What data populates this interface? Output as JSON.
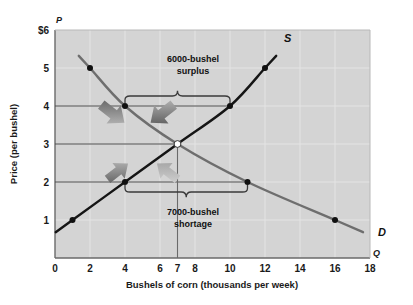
{
  "chart_data": {
    "type": "line",
    "title": "",
    "xlabel": "Bushels of corn (thousands per week)",
    "ylabel": "Price (per bushel)",
    "x_axis_letter": "Q",
    "y_axis_letter": "P",
    "xlim": [
      0,
      18
    ],
    "ylim": [
      0,
      6
    ],
    "grid": true,
    "xticks": [
      "0",
      "2",
      "4",
      "6",
      "7",
      "8",
      "10",
      "12",
      "14",
      "16",
      "18"
    ],
    "xtick_values": [
      0,
      2,
      4,
      6,
      7,
      8,
      10,
      12,
      14,
      16,
      18
    ],
    "yticks": [
      "$6",
      "5",
      "4",
      "3",
      "2",
      "1"
    ],
    "ytick_values": [
      6,
      5,
      4,
      3,
      2,
      1
    ],
    "series": [
      {
        "name": "S",
        "label": "S",
        "description": "Supply curve, upward sloping",
        "color": "#1a1a1a",
        "points": [
          {
            "x": 1,
            "y": 1
          },
          {
            "x": 4,
            "y": 2
          },
          {
            "x": 7,
            "y": 3
          },
          {
            "x": 10,
            "y": 4
          },
          {
            "x": 12,
            "y": 5
          }
        ]
      },
      {
        "name": "D",
        "label": "D",
        "description": "Demand curve, downward sloping",
        "color": "#6e6e6e",
        "points": [
          {
            "x": 2,
            "y": 5
          },
          {
            "x": 4,
            "y": 4
          },
          {
            "x": 7,
            "y": 3
          },
          {
            "x": 11,
            "y": 2
          },
          {
            "x": 16,
            "y": 1
          }
        ]
      }
    ],
    "equilibrium": {
      "x": 7,
      "y": 3,
      "marker": "hollow-circle"
    },
    "reference_lines": [
      {
        "type": "horizontal",
        "value": 4,
        "from_x": 0,
        "to_x": 10
      },
      {
        "type": "horizontal",
        "value": 3,
        "from_x": 0,
        "to_x": 7
      },
      {
        "type": "horizontal",
        "value": 2,
        "from_x": 0,
        "to_x": 11
      },
      {
        "type": "vertical",
        "value": 7,
        "from_y": 0,
        "to_y": 3
      }
    ],
    "annotations": [
      {
        "id": "surplus",
        "line1": "6000-bushel",
        "line2": "surplus",
        "price": 4,
        "from_x": 4,
        "to_x": 10,
        "quantity": 6000,
        "brace": "below-text"
      },
      {
        "id": "shortage",
        "line1": "7000-bushel",
        "line2": "shortage",
        "price": 2,
        "from_x": 4,
        "to_x": 11,
        "quantity": 7000,
        "brace": "above-text"
      }
    ],
    "arrows": [
      {
        "id": "surplus-left-arrow",
        "direction": "down-right",
        "region": "surplus"
      },
      {
        "id": "surplus-right-arrow",
        "direction": "down-left",
        "region": "surplus"
      },
      {
        "id": "shortage-left-arrow",
        "direction": "up-right",
        "region": "shortage"
      },
      {
        "id": "shortage-right-arrow",
        "direction": "up-left",
        "region": "shortage"
      }
    ],
    "colors": {
      "plot_background": "#d4d4d4",
      "page_background": "#ffffff",
      "gridline": "#e8e8e8",
      "supply": "#1a1a1a",
      "demand": "#6e6e6e",
      "reference_line": "#555555",
      "arrow": "#8d8d8d",
      "text": "#1a1a1a"
    }
  }
}
